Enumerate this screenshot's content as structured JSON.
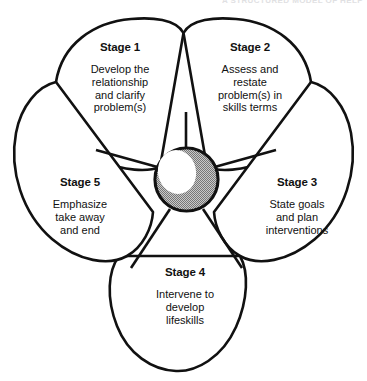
{
  "diagram": {
    "title_fragment": "A STRUCTURED MODEL OF HELP",
    "center": {
      "name": "hub",
      "fill_color": "#9d9d9d",
      "stroke_color": "#111111",
      "highlight_color": "#ffffff"
    },
    "colors": {
      "petal_fill": "#ffffff",
      "outline": "#111111",
      "text": "#111111",
      "hub_grey": "#9d9d9d"
    },
    "petals": [
      {
        "id": "stage-1",
        "title": "Stage 1",
        "lines": [
          "Develop the",
          "relationship",
          "and clarify",
          "problem(s)"
        ]
      },
      {
        "id": "stage-2",
        "title": "Stage 2",
        "lines": [
          "Assess and",
          "restate",
          "problem(s) in",
          "skills terms"
        ]
      },
      {
        "id": "stage-3",
        "title": "Stage 3",
        "lines": [
          "State goals",
          "and plan",
          "interventions"
        ]
      },
      {
        "id": "stage-4",
        "title": "Stage 4",
        "lines": [
          "Intervene to",
          "develop",
          "lifeskills"
        ]
      },
      {
        "id": "stage-5",
        "title": "Stage 5",
        "lines": [
          "Emphasize",
          "take away",
          "and end"
        ]
      }
    ]
  }
}
